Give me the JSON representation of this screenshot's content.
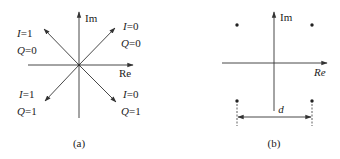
{
  "panel_a": {
    "caption": "(a)",
    "axes": {
      "imag_label": "Im",
      "real_label": "Re"
    },
    "quadrants": [
      {
        "position": "upper-left",
        "i_label": "I=1",
        "q_label": "Q=0",
        "i_var": "I",
        "i_val": "=1",
        "q_var": "Q",
        "q_val": "=0"
      },
      {
        "position": "upper-right",
        "i_label": "I=0",
        "q_label": "Q=0",
        "i_var": "I",
        "i_val": "=0",
        "q_var": "Q",
        "q_val": "=0"
      },
      {
        "position": "lower-left",
        "i_label": "I=1",
        "q_label": "Q=1",
        "i_var": "I",
        "i_val": "=1",
        "q_var": "Q",
        "q_val": "=1"
      },
      {
        "position": "lower-right",
        "i_label": "I=0",
        "q_label": "Q=1",
        "i_var": "I",
        "i_val": "=0",
        "q_var": "Q",
        "q_val": "=1"
      }
    ]
  },
  "panel_b": {
    "caption": "(b)",
    "axes": {
      "imag_label": "Im",
      "real_label": "Re"
    },
    "constellation_points": 4,
    "distance_label": "d"
  },
  "colors": {
    "line": "#333333",
    "text": "#222222",
    "background": "#ffffff"
  }
}
